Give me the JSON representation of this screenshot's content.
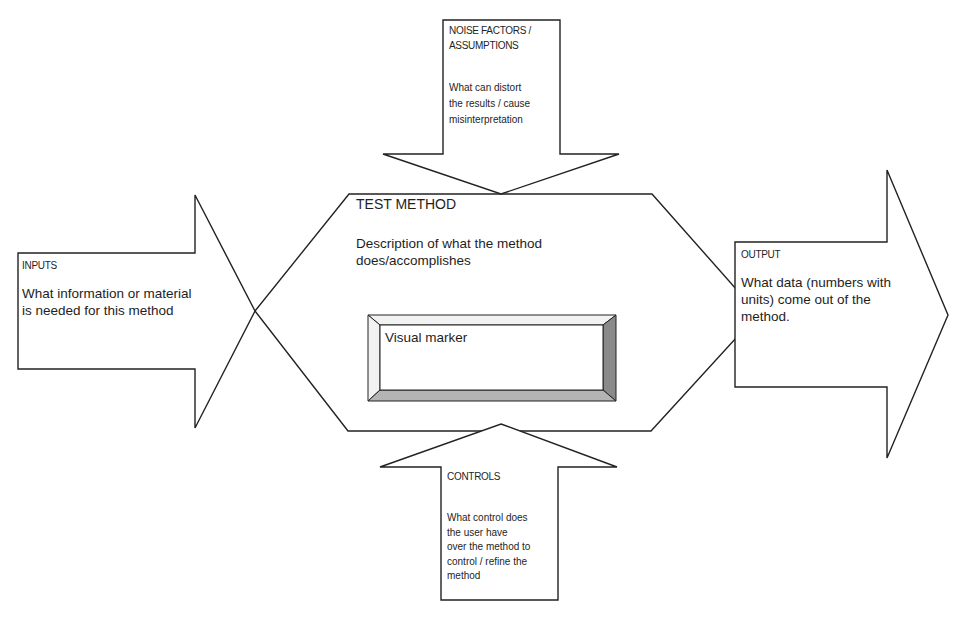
{
  "diagram": {
    "type": "process-flow",
    "colors": {
      "stroke": "#222222",
      "fill": "#ffffff",
      "bevel_dark": "#8a8a8a",
      "bevel_light": "#b4b4b4",
      "bevel_top": "#f2f2f2"
    },
    "inputs": {
      "title": "INPUTS",
      "description": "What information or material is needed for this method",
      "lines": [
        "What information or material",
        "is needed for this method"
      ]
    },
    "noise": {
      "title_lines": [
        "NOISE FACTORS /",
        "ASSUMPTIONS"
      ],
      "description_lines": [
        "What can distort",
        "the results / cause",
        "misinterpretation"
      ]
    },
    "test_method": {
      "title": "TEST METHOD",
      "description_lines": [
        "Description of what the method",
        "does/accomplishes"
      ],
      "visual_marker": "Visual marker"
    },
    "output": {
      "title": "OUTPUT",
      "description_lines": [
        "What data (numbers with",
        "units) come out of the",
        "method."
      ]
    },
    "controls": {
      "title": "CONTROLS",
      "description_lines": [
        "What control does",
        "the user have",
        "over the method to",
        "control / refine the",
        "method"
      ]
    },
    "connections": [
      {
        "from": "INPUTS",
        "to": "TEST METHOD"
      },
      {
        "from": "NOISE FACTORS / ASSUMPTIONS",
        "to": "TEST METHOD"
      },
      {
        "from": "CONTROLS",
        "to": "TEST METHOD"
      },
      {
        "from": "TEST METHOD",
        "to": "OUTPUT"
      }
    ]
  }
}
